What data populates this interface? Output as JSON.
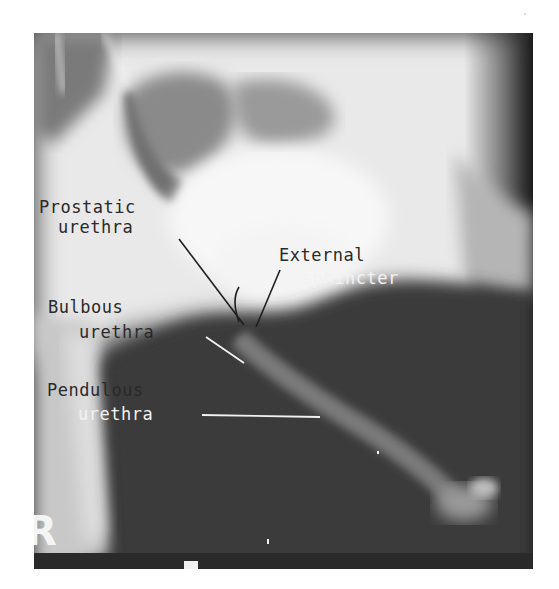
{
  "figure": {
    "side_marker": "R",
    "labels": {
      "prostatic": [
        "Prostatic",
        "urethra"
      ],
      "external": [
        "External",
        "sphincter"
      ],
      "bulbous": [
        "Bulbous",
        "urethra"
      ],
      "pendulous": [
        "Pendulous",
        "urethra"
      ]
    },
    "colors": {
      "background": "#ffffff",
      "bright_contrast": "#f4f4f4",
      "soft_tissue": "#3a3a3a",
      "dark_label_text": "#2a2a2a",
      "light_label_text": "#f2f2f2"
    }
  }
}
